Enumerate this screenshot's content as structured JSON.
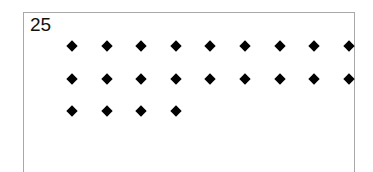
{
  "card": {
    "number_label": "25",
    "dot_shape": "diamond",
    "dot_color": "#000000",
    "rows": [
      9,
      9,
      4
    ],
    "total_dots": 22
  }
}
